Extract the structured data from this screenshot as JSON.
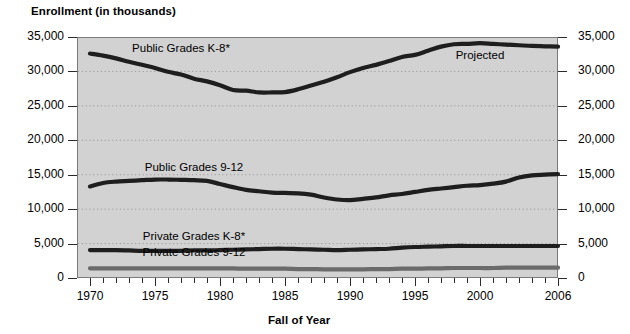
{
  "chart_data": {
    "type": "line",
    "title": "",
    "ylabel": "Enrollment (in thousands)",
    "xlabel": "Fall of Year",
    "xlim": [
      1969,
      2006
    ],
    "ylim": [
      0,
      35000
    ],
    "grid": true,
    "grid_style": "dotted-horizontal",
    "legend": "inline-series-labels",
    "y_ticks": [
      "0",
      "5,000",
      "10,000",
      "15,000",
      "20,000",
      "25,000",
      "30,000",
      "35,000"
    ],
    "y_tick_values": [
      0,
      5000,
      10000,
      15000,
      20000,
      25000,
      30000,
      35000
    ],
    "x_ticks": [
      "1970",
      "1975",
      "1980",
      "1985",
      "1990",
      "1995",
      "2000",
      "2006"
    ],
    "x_tick_values": [
      1970,
      1975,
      1980,
      1985,
      1990,
      1995,
      2000,
      2006
    ],
    "annotations": [
      {
        "text": "Projected",
        "x": 2000,
        "y": 32100
      }
    ],
    "x": [
      1970,
      1971,
      1972,
      1973,
      1974,
      1975,
      1976,
      1977,
      1978,
      1979,
      1980,
      1981,
      1982,
      1983,
      1984,
      1985,
      1986,
      1987,
      1988,
      1989,
      1990,
      1991,
      1992,
      1993,
      1994,
      1995,
      1996,
      1997,
      1998,
      1999,
      2000,
      2001,
      2002,
      2003,
      2004,
      2005,
      2006
    ],
    "series": [
      {
        "name": "Public Grades K-8*",
        "color": "#1e1e1e",
        "label_x": 1977,
        "label_y": 33100,
        "values": [
          32600,
          32300,
          31900,
          31400,
          30970,
          30500,
          29950,
          29550,
          28950,
          28550,
          28000,
          27300,
          27200,
          26950,
          26950,
          27000,
          27400,
          27950,
          28500,
          29150,
          29900,
          30500,
          30950,
          31500,
          32100,
          32400,
          33000,
          33600,
          33950,
          34000,
          34100,
          34000,
          33900,
          33800,
          33700,
          33650,
          33600
        ]
      },
      {
        "name": "Public Grades 9-12",
        "color": "#1e1e1e",
        "label_x": 1978,
        "label_y": 15850,
        "values": [
          13300,
          13800,
          14000,
          14100,
          14200,
          14300,
          14300,
          14250,
          14200,
          14100,
          13650,
          13200,
          12800,
          12600,
          12400,
          12350,
          12300,
          12100,
          11700,
          11400,
          11300,
          11500,
          11700,
          12000,
          12200,
          12500,
          12800,
          13000,
          13200,
          13400,
          13500,
          13700,
          14000,
          14600,
          14900,
          15000,
          15100
        ]
      },
      {
        "name": "Private Grades K-8*",
        "color": "#1e1e1e",
        "label_x": 1978,
        "label_y": 5850,
        "values": [
          4050,
          4050,
          4050,
          4000,
          3950,
          3950,
          3950,
          3950,
          4000,
          4000,
          4050,
          4100,
          4150,
          4200,
          4250,
          4250,
          4200,
          4150,
          4100,
          4050,
          4100,
          4150,
          4200,
          4250,
          4400,
          4500,
          4550,
          4600,
          4650,
          4650,
          4650,
          4650,
          4650,
          4650,
          4650,
          4650,
          4650
        ]
      },
      {
        "name": "Private Grades 9-12",
        "color": "#6b6b6b",
        "label_x": 1978,
        "label_y": 3450,
        "values": [
          1400,
          1400,
          1400,
          1400,
          1400,
          1400,
          1400,
          1400,
          1400,
          1400,
          1400,
          1400,
          1350,
          1350,
          1350,
          1350,
          1300,
          1300,
          1250,
          1250,
          1250,
          1250,
          1300,
          1300,
          1350,
          1350,
          1400,
          1400,
          1450,
          1450,
          1450,
          1450,
          1500,
          1500,
          1500,
          1500,
          1500
        ]
      }
    ]
  },
  "axes": {
    "plot_bg": "#d2d2d2",
    "axis_color": "#2a2a2a",
    "grid_color": "#9b9b9b"
  }
}
